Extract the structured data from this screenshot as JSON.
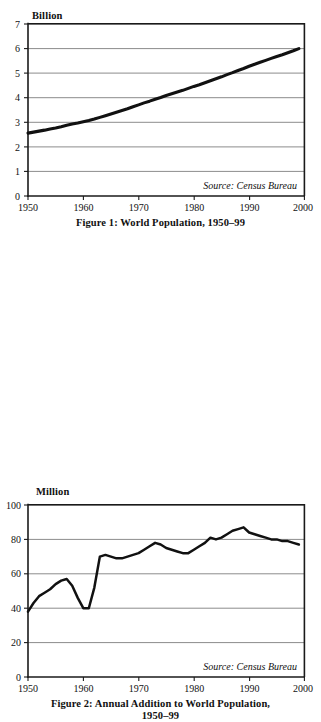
{
  "figures": [
    {
      "unit_label": "Billion",
      "source_note": "Source: Census Bureau",
      "caption_line1": "Figure 1: World Population, 1950–99",
      "caption_line2": ""
    },
    {
      "unit_label": "Million",
      "source_note": "Source: Census Bureau",
      "caption_line1": "Figure 2: Annual Addition to World Population,",
      "caption_line2": "1950–99"
    }
  ],
  "chart_data": [
    {
      "type": "line",
      "title": "Figure 1: World Population, 1950–99",
      "xlabel": "",
      "ylabel": "Billion",
      "xlim": [
        1950,
        2000
      ],
      "ylim": [
        0,
        7
      ],
      "xticks": [
        1950,
        1960,
        1970,
        1980,
        1990,
        2000
      ],
      "yticks": [
        0,
        1,
        2,
        3,
        4,
        5,
        6,
        7
      ],
      "grid": true,
      "legend": "none",
      "annotations": [
        "Source: Census Bureau"
      ],
      "x": [
        1950,
        1951,
        1952,
        1953,
        1954,
        1955,
        1956,
        1957,
        1958,
        1959,
        1960,
        1961,
        1962,
        1963,
        1964,
        1965,
        1966,
        1967,
        1968,
        1969,
        1970,
        1971,
        1972,
        1973,
        1974,
        1975,
        1976,
        1977,
        1978,
        1979,
        1980,
        1981,
        1982,
        1983,
        1984,
        1985,
        1986,
        1987,
        1988,
        1989,
        1990,
        1991,
        1992,
        1993,
        1994,
        1995,
        1996,
        1997,
        1998,
        1999
      ],
      "values": [
        2.56,
        2.6,
        2.64,
        2.68,
        2.73,
        2.77,
        2.82,
        2.88,
        2.93,
        2.97,
        3.02,
        3.07,
        3.13,
        3.2,
        3.27,
        3.34,
        3.41,
        3.48,
        3.55,
        3.63,
        3.71,
        3.79,
        3.86,
        3.94,
        4.01,
        4.09,
        4.16,
        4.23,
        4.3,
        4.38,
        4.46,
        4.53,
        4.61,
        4.69,
        4.77,
        4.85,
        4.94,
        5.02,
        5.11,
        5.19,
        5.28,
        5.36,
        5.44,
        5.52,
        5.6,
        5.68,
        5.75,
        5.83,
        5.91,
        6.0
      ]
    },
    {
      "type": "line",
      "title": "Figure 2: Annual Addition to World Population, 1950–99",
      "xlabel": "",
      "ylabel": "Million",
      "xlim": [
        1950,
        2000
      ],
      "ylim": [
        0,
        100
      ],
      "xticks": [
        1950,
        1960,
        1970,
        1980,
        1990,
        2000
      ],
      "yticks": [
        0,
        20,
        40,
        60,
        80,
        100
      ],
      "grid": true,
      "legend": "none",
      "annotations": [
        "Source: Census Bureau"
      ],
      "x": [
        1950,
        1951,
        1952,
        1953,
        1954,
        1955,
        1956,
        1957,
        1958,
        1959,
        1960,
        1961,
        1962,
        1963,
        1964,
        1965,
        1966,
        1967,
        1968,
        1969,
        1970,
        1971,
        1972,
        1973,
        1974,
        1975,
        1976,
        1977,
        1978,
        1979,
        1980,
        1981,
        1982,
        1983,
        1984,
        1985,
        1986,
        1987,
        1988,
        1989,
        1990,
        1991,
        1992,
        1993,
        1994,
        1995,
        1996,
        1997,
        1998,
        1999
      ],
      "values": [
        38,
        43,
        47,
        49,
        51,
        54,
        56,
        57,
        53,
        46,
        40,
        40,
        52,
        70,
        71,
        70,
        69,
        69,
        70,
        71,
        72,
        74,
        76,
        78,
        77,
        75,
        74,
        73,
        72,
        72,
        74,
        76,
        78,
        81,
        80,
        81,
        83,
        85,
        86,
        87,
        84,
        83,
        82,
        81,
        80,
        80,
        79,
        79,
        78,
        77
      ]
    }
  ]
}
